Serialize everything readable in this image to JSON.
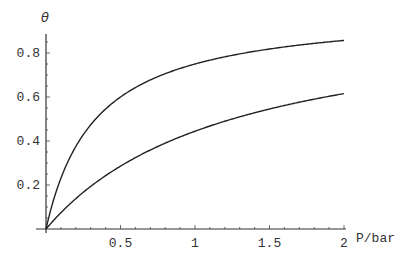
{
  "chart_data": {
    "type": "line",
    "title": "",
    "xlabel": "P/bar",
    "ylabel": "θ",
    "xlim": [
      0,
      2
    ],
    "ylim": [
      0,
      0.88
    ],
    "x_ticks": [
      0.5,
      1,
      1.5,
      2
    ],
    "x_tick_labels": [
      "0.5",
      "1",
      "1.5",
      "2"
    ],
    "y_ticks": [
      0.2,
      0.4,
      0.6,
      0.8
    ],
    "y_tick_labels": [
      "0.2",
      "0.4",
      "0.6",
      "0.8"
    ],
    "grid": false,
    "legend": null,
    "x": [
      0,
      0.1,
      0.2,
      0.3,
      0.4,
      0.5,
      0.6,
      0.7,
      0.8,
      0.9,
      1.0,
      1.1,
      1.2,
      1.3,
      1.4,
      1.5,
      1.6,
      1.7,
      1.8,
      1.9,
      2.0
    ],
    "series": [
      {
        "name": "upper curve (K≈3)",
        "values": [
          0,
          0.231,
          0.375,
          0.474,
          0.545,
          0.6,
          0.643,
          0.677,
          0.706,
          0.73,
          0.75,
          0.767,
          0.783,
          0.796,
          0.808,
          0.818,
          0.828,
          0.836,
          0.844,
          0.851,
          0.857
        ]
      },
      {
        "name": "lower curve (K≈0.8)",
        "values": [
          0,
          0.074,
          0.138,
          0.194,
          0.242,
          0.286,
          0.324,
          0.359,
          0.39,
          0.419,
          0.444,
          0.468,
          0.49,
          0.51,
          0.528,
          0.545,
          0.561,
          0.576,
          0.59,
          0.603,
          0.615
        ]
      }
    ]
  }
}
